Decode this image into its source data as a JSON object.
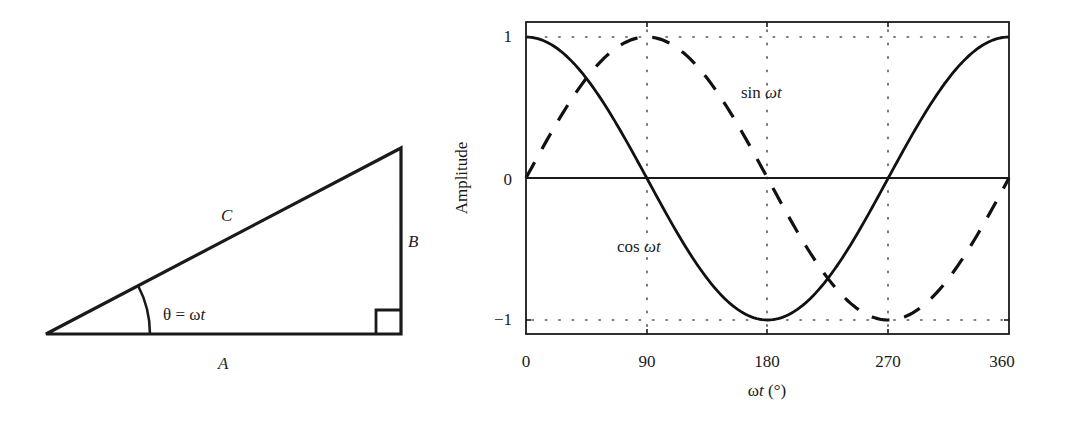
{
  "triangle": {
    "vertices": {
      "left": [
        46,
        334
      ],
      "bottom_right": [
        401,
        334
      ],
      "top_right": [
        401,
        148
      ]
    },
    "labels": {
      "hypotenuse": "C",
      "opposite": "B",
      "adjacent": "A",
      "angle_theta": "θ",
      "angle_eq": " = ",
      "angle_omega": "ω",
      "angle_t": "t"
    },
    "right_angle_marker_size": 25,
    "angle_arc_radius": 104
  },
  "plot": {
    "y_axis_label": "Amplitude",
    "x_axis_label_omega": "ω",
    "x_axis_label_t": "t",
    "x_axis_label_unit": " (°)",
    "x_ticks": [
      "0",
      "90",
      "180",
      "270",
      "360"
    ],
    "y_ticks": [
      "1",
      "0",
      "−1"
    ],
    "curve_labels": {
      "sin_fn": "sin ",
      "sin_omega": "ω",
      "sin_t": "t",
      "cos_fn": "cos ",
      "cos_omega": "ω",
      "cos_t": "t"
    }
  },
  "chart_data": {
    "type": "line",
    "title": "",
    "xlabel": "ωt (°)",
    "ylabel": "Amplitude",
    "xlim": [
      0,
      360
    ],
    "ylim": [
      -1.1,
      1.1
    ],
    "x_ticks": [
      0,
      90,
      180,
      270,
      360
    ],
    "y_ticks": [
      -1,
      0,
      1
    ],
    "grid": "dotted at x=90,180,270 and y=±1",
    "legend_position": "inline annotations",
    "x": [
      0,
      30,
      60,
      90,
      120,
      150,
      180,
      210,
      240,
      270,
      300,
      330,
      360
    ],
    "series": [
      {
        "name": "cos ωt",
        "style": "solid",
        "values": [
          1,
          0.866,
          0.5,
          0,
          -0.5,
          -0.866,
          -1,
          -0.866,
          -0.5,
          0,
          0.5,
          0.866,
          1
        ]
      },
      {
        "name": "sin ωt",
        "style": "dashed",
        "values": [
          0,
          0.5,
          0.866,
          1,
          0.866,
          0.5,
          0,
          -0.5,
          -0.866,
          -1,
          -0.866,
          -0.5,
          0
        ]
      }
    ],
    "annotations": [
      {
        "text": "sin ωt",
        "x": 200,
        "y": 0.75
      },
      {
        "text": "cos ωt",
        "x": 70,
        "y": -0.55
      }
    ]
  }
}
